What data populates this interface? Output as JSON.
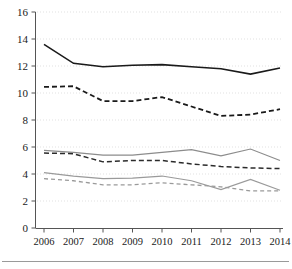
{
  "chart_data": {
    "type": "line",
    "title": "",
    "xlabel": "",
    "ylabel": "",
    "categories": [
      "2006",
      "2007",
      "2008",
      "2009",
      "2010",
      "2011",
      "2012",
      "2013",
      "2014"
    ],
    "x": [
      2006,
      2007,
      2008,
      2009,
      2010,
      2011,
      2012,
      2013,
      2014
    ],
    "ylim": [
      0,
      16
    ],
    "yticks": [
      0,
      2,
      4,
      6,
      8,
      10,
      12,
      14,
      16
    ],
    "ytick_labels": [
      "0",
      "2",
      "4",
      "6",
      "8",
      "10",
      "12",
      "14",
      "16"
    ],
    "grid": true,
    "grid_axis": "y",
    "legend": "none",
    "series": [
      {
        "name": "series-1",
        "style": "solid",
        "color": "#1a1a1a",
        "width": 1.6,
        "values": [
          13.6,
          12.2,
          11.95,
          12.05,
          12.1,
          11.95,
          11.8,
          11.4,
          11.85
        ]
      },
      {
        "name": "series-2",
        "style": "dashed",
        "color": "#1a1a1a",
        "width": 1.8,
        "values": [
          10.45,
          10.5,
          9.4,
          9.4,
          9.7,
          9.0,
          8.3,
          8.4,
          8.8
        ]
      },
      {
        "name": "series-3",
        "style": "solid",
        "color": "#8c8c8c",
        "width": 1.2,
        "values": [
          5.75,
          5.6,
          5.4,
          5.4,
          5.6,
          5.8,
          5.35,
          5.85,
          5.0
        ]
      },
      {
        "name": "series-4",
        "style": "dashed",
        "color": "#2b2b2b",
        "width": 1.5,
        "values": [
          5.55,
          5.5,
          4.9,
          5.0,
          5.0,
          4.75,
          4.55,
          4.45,
          4.4
        ]
      },
      {
        "name": "series-5",
        "style": "solid",
        "color": "#9a9a9a",
        "width": 1.2,
        "values": [
          4.1,
          3.85,
          3.65,
          3.7,
          3.85,
          3.5,
          2.85,
          3.6,
          2.8
        ]
      },
      {
        "name": "series-6",
        "style": "dashed",
        "color": "#9a9a9a",
        "width": 1.3,
        "values": [
          3.65,
          3.5,
          3.2,
          3.2,
          3.35,
          3.2,
          3.05,
          2.75,
          2.75
        ]
      }
    ]
  }
}
